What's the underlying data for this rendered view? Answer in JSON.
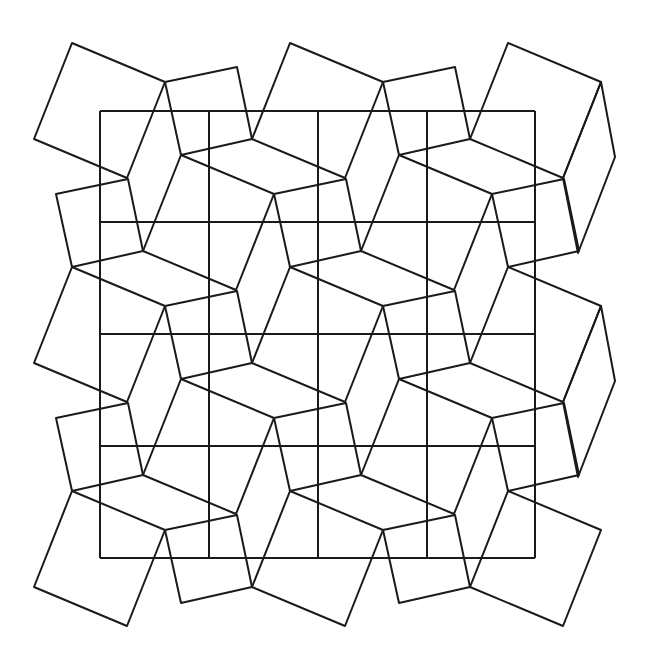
{
  "header": {
    "text": ""
  },
  "diagram": {
    "stroke_color": "#1a1a1a",
    "background": "#ffffff",
    "grid": {
      "x_lines": [
        100,
        209,
        318,
        427,
        535
      ],
      "y_lines": [
        111,
        222,
        334,
        446,
        558
      ],
      "rows": 4,
      "cols": 4
    },
    "tile": {
      "large_square_offsets": [
        [
          0,
          0
        ],
        [
          93,
          39
        ],
        [
          55,
          135
        ],
        [
          -38,
          96
        ]
      ],
      "small_square_offsets": [
        [
          93,
          39
        ],
        [
          165,
          24
        ],
        [
          180,
          96
        ],
        [
          109,
          112
        ]
      ]
    },
    "large_squares_at": [
      [
        72,
        43
      ],
      [
        290,
        43
      ],
      [
        508,
        43
      ],
      [
        181,
        155
      ],
      [
        399,
        155
      ],
      [
        72,
        267
      ],
      [
        290,
        267
      ],
      [
        508,
        267
      ],
      [
        181,
        379
      ],
      [
        399,
        379
      ],
      [
        72,
        491
      ],
      [
        290,
        491
      ],
      [
        508,
        491
      ]
    ],
    "small_squares_at": [
      [
        72,
        43
      ],
      [
        290,
        43
      ],
      [
        -37,
        155
      ],
      [
        181,
        155
      ],
      [
        399,
        155
      ],
      [
        72,
        267
      ],
      [
        290,
        267
      ],
      [
        -37,
        379
      ],
      [
        181,
        379
      ],
      [
        399,
        379
      ],
      [
        72,
        491
      ],
      [
        290,
        491
      ]
    ],
    "edge_parallelograms": [
      [
        [
          601,
          82
        ],
        [
          615,
          157
        ],
        [
          578,
          253
        ],
        [
          563,
          178
        ]
      ],
      [
        [
          601,
          306
        ],
        [
          615,
          381
        ],
        [
          578,
          477
        ],
        [
          563,
          402
        ]
      ]
    ]
  }
}
